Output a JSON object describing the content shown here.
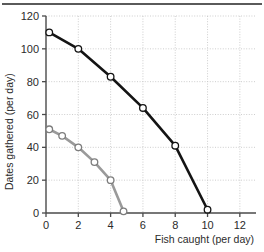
{
  "figure": {
    "top_rule": true,
    "background_color": "#ffffff"
  },
  "chart_data": {
    "type": "line",
    "title": "",
    "subtitle": "",
    "xlabel": "Fish caught (per day)",
    "ylabel": "Dates gathered (per day)",
    "xlim": [
      0,
      13
    ],
    "ylim": [
      0,
      120
    ],
    "xticks": [
      0,
      2,
      4,
      6,
      8,
      10,
      12
    ],
    "yticks": [
      0,
      20,
      40,
      60,
      80,
      100,
      120
    ],
    "xtick_labels": [
      "0",
      "2",
      "4",
      "6",
      "8",
      "10",
      "12"
    ],
    "ytick_labels": [
      "0",
      "20",
      "40",
      "60",
      "80",
      "100",
      "120"
    ],
    "grid": true,
    "grid_style": "dotted",
    "grid_color": "#c8c8c8",
    "legend": null,
    "legend_position": "none",
    "series": [
      {
        "name": "outer-frontier",
        "color": "#141414",
        "marker": "open-circle",
        "marker_face_color": "#ffffff",
        "line_width": 2.6,
        "points": [
          {
            "x": 0.2,
            "y": 110
          },
          {
            "x": 2.0,
            "y": 100
          },
          {
            "x": 4.0,
            "y": 83
          },
          {
            "x": 6.0,
            "y": 64
          },
          {
            "x": 8.0,
            "y": 41
          },
          {
            "x": 10.0,
            "y": 2
          }
        ]
      },
      {
        "name": "inner-frontier",
        "color": "#9a9a9a",
        "marker": "open-circle",
        "marker_face_color": "#ffffff",
        "line_width": 2.6,
        "points": [
          {
            "x": 0.2,
            "y": 51
          },
          {
            "x": 1.0,
            "y": 47
          },
          {
            "x": 2.0,
            "y": 40
          },
          {
            "x": 3.0,
            "y": 31
          },
          {
            "x": 4.0,
            "y": 20
          },
          {
            "x": 4.8,
            "y": 1
          }
        ]
      }
    ]
  },
  "axes": {
    "axis_color": "#4a4a4a",
    "tick_color": "#4a4a4a"
  }
}
